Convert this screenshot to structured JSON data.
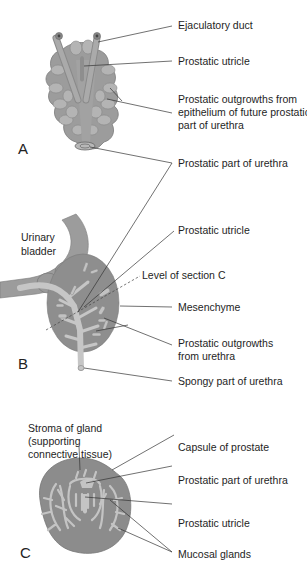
{
  "figure": {
    "panels": [
      {
        "id": "A",
        "letter": "A",
        "labels": {
          "ejaculatory_duct": "Ejaculatory duct",
          "prostatic_utricle": "Prostatic utricle",
          "outgrowths_1": "Prostatic outgrowths from",
          "outgrowths_2": "epithelium of future prostatic",
          "outgrowths_3": "part of urethra",
          "prostatic_urethra": "Prostatic part of urethra"
        }
      },
      {
        "id": "B",
        "letter": "B",
        "labels": {
          "urinary_bladder_1": "Urinary",
          "urinary_bladder_2": "bladder",
          "prostatic_utricle": "Prostatic utricle",
          "level_of_section": "Level of section C",
          "mesenchyme": "Mesenchyme",
          "outgrowths_1": "Prostatic outgrowths",
          "outgrowths_2": "from urethra",
          "spongy_urethra": "Spongy part of urethra"
        }
      },
      {
        "id": "C",
        "letter": "C",
        "labels": {
          "stroma_1": "Stroma of gland",
          "stroma_2": "(supporting",
          "stroma_3": "connective tissue)",
          "capsule": "Capsule of prostate",
          "prostatic_urethra": "Prostatic part of urethra",
          "prostatic_utricle": "Prostatic utricle",
          "mucosal_glands": "Mucosal glands"
        }
      }
    ],
    "colors": {
      "tissue_gray": "#9a9a9a",
      "tissue_light": "#c4c4c4",
      "tissue_dark": "#7e7e7e",
      "leader_line": "#333333",
      "background": "#ffffff"
    }
  }
}
